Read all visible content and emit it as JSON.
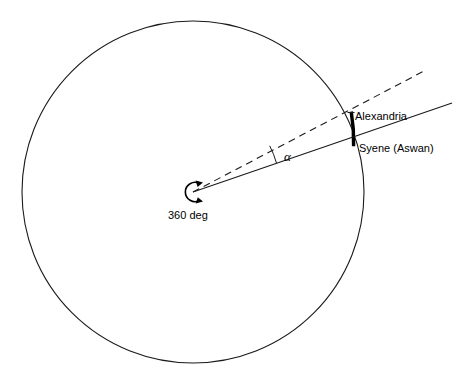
{
  "diagram": {
    "labels": {
      "alexandria": "Alexandria",
      "syene": "Syene (Aswan)",
      "angle": "α",
      "rotation": "360 deg"
    },
    "colors": {
      "stroke": "#1a1a1a",
      "arc_highlight": "#000000",
      "background": "#ffffff",
      "text": "#000000"
    },
    "geometry": {
      "circle_center_x": 193,
      "circle_center_y": 192,
      "circle_radius": 171,
      "alexandria_point_x": 351,
      "alexandria_point_y": 112,
      "syene_point_x": 353,
      "syene_point_y": 146,
      "solid_ray_end_x": 452,
      "solid_ray_end_y": 103,
      "dashed_ray_end_x": 426,
      "dashed_ray_end_y": 70,
      "angle_arc_radius": 88,
      "angle_degrees": 12
    }
  }
}
